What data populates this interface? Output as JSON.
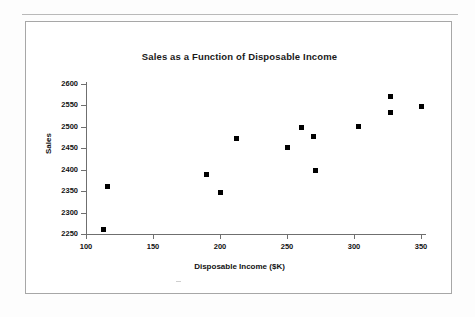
{
  "page": {
    "background_color": "#fdfdfd",
    "rule_color": "#b9b9b9",
    "frame_color": "#a7a7a7"
  },
  "chart_data": {
    "type": "scatter",
    "title": "Sales as a Function of Disposable Income",
    "xlabel": "Disposable Income ($K)",
    "ylabel": "Sales",
    "xlim": [
      100,
      350
    ],
    "ylim": [
      2250,
      2600
    ],
    "xticks": [
      100,
      150,
      200,
      250,
      300,
      350
    ],
    "yticks": [
      2250,
      2300,
      2350,
      2400,
      2450,
      2500,
      2550,
      2600
    ],
    "grid": false,
    "legend": null,
    "marker": {
      "shape": "square",
      "color": "#000000",
      "size_px": 5
    },
    "series": [
      {
        "name": "Sales vs Disposable Income",
        "points": [
          {
            "x": 113,
            "y": 2260
          },
          {
            "x": 116,
            "y": 2362
          },
          {
            "x": 190,
            "y": 2388
          },
          {
            "x": 200,
            "y": 2348
          },
          {
            "x": 212,
            "y": 2472
          },
          {
            "x": 250,
            "y": 2452
          },
          {
            "x": 261,
            "y": 2498
          },
          {
            "x": 270,
            "y": 2478
          },
          {
            "x": 271,
            "y": 2398
          },
          {
            "x": 303,
            "y": 2500
          },
          {
            "x": 327,
            "y": 2533
          },
          {
            "x": 327,
            "y": 2572
          },
          {
            "x": 350,
            "y": 2548
          }
        ]
      }
    ]
  }
}
